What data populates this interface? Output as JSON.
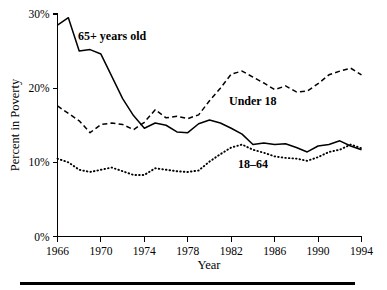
{
  "chart_data": {
    "type": "line",
    "title": "",
    "subtitle": "",
    "xlabel": "Year",
    "ylabel": "Percent in Poverty",
    "xlim": [
      1966,
      1994
    ],
    "ylim": [
      0,
      30
    ],
    "grid": false,
    "legend_position": "inline-annotations",
    "xticks": [
      1966,
      1970,
      1974,
      1978,
      1982,
      1986,
      1990,
      1994
    ],
    "xtick_labels": [
      "1966",
      "1970",
      "1974",
      "1978",
      "1982",
      "1986",
      "1990",
      "1994"
    ],
    "yticks": [
      0,
      10,
      20,
      30
    ],
    "ytick_labels": [
      "0%",
      "10%",
      "20%",
      "30%"
    ],
    "x": [
      1966,
      1967,
      1968,
      1969,
      1970,
      1971,
      1972,
      1973,
      1974,
      1975,
      1976,
      1977,
      1978,
      1979,
      1980,
      1981,
      1982,
      1983,
      1984,
      1985,
      1986,
      1987,
      1988,
      1989,
      1990,
      1991,
      1992,
      1993,
      1994
    ],
    "series": [
      {
        "name": "65+ years old",
        "style": "solid",
        "label_text": "65+ years old",
        "values": [
          28.5,
          29.5,
          25.0,
          25.2,
          24.6,
          21.6,
          18.6,
          16.3,
          14.6,
          15.3,
          15.0,
          14.1,
          14.0,
          15.2,
          15.7,
          15.3,
          14.6,
          13.8,
          12.4,
          12.6,
          12.4,
          12.5,
          12.0,
          11.4,
          12.2,
          12.4,
          12.9,
          12.2,
          11.7
        ]
      },
      {
        "name": "Under 18",
        "style": "dashed",
        "label_text": "Under 18",
        "values": [
          17.6,
          16.6,
          15.6,
          14.0,
          15.1,
          15.3,
          15.1,
          14.4,
          15.4,
          17.1,
          16.0,
          16.2,
          15.9,
          16.4,
          18.3,
          20.0,
          21.9,
          22.3,
          21.5,
          20.7,
          19.8,
          20.3,
          19.5,
          19.6,
          20.6,
          21.8,
          22.3,
          22.7,
          21.8
        ]
      },
      {
        "name": "18-64",
        "style": "dotted",
        "label_text": "18–64",
        "values": [
          10.5,
          10.0,
          9.0,
          8.7,
          9.0,
          9.3,
          8.8,
          8.3,
          8.3,
          9.2,
          9.0,
          8.8,
          8.7,
          8.9,
          10.1,
          11.1,
          12.0,
          12.4,
          11.7,
          11.3,
          10.8,
          10.6,
          10.5,
          10.2,
          10.7,
          11.4,
          11.7,
          12.4,
          11.9
        ]
      }
    ],
    "annotations": [
      {
        "text": "65+ years old",
        "x_px": 78,
        "y_px": 40,
        "bold": true
      },
      {
        "text": "Under 18",
        "x_px": 229,
        "y_px": 105,
        "bold": true
      },
      {
        "text": "18–64",
        "x_px": 238,
        "y_px": 168,
        "bold": true
      }
    ]
  },
  "footer": {
    "rule_color": "#000000"
  }
}
